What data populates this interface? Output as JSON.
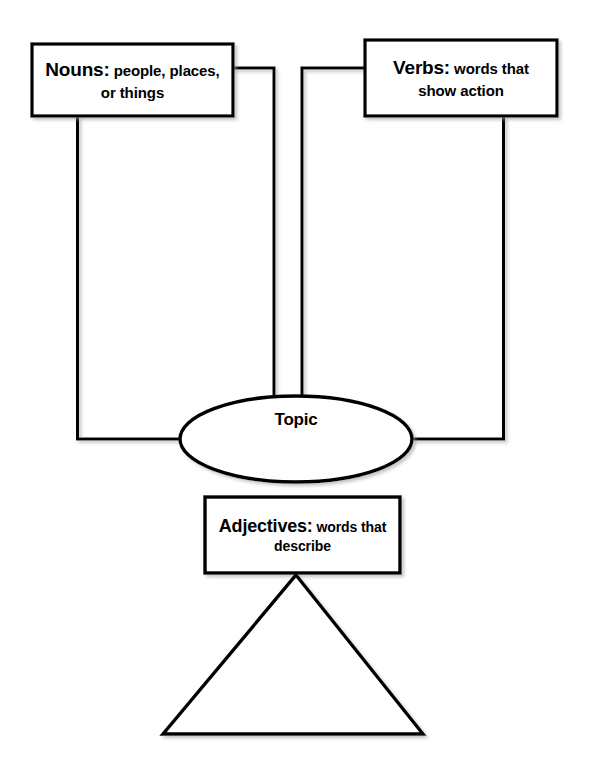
{
  "page": {
    "background_color": "#ffffff",
    "stroke_color": "#000000",
    "fill_color": "#ffffff"
  },
  "nodes": {
    "nouns": {
      "shape": "rectangle",
      "term": "Nouns:",
      "gloss_line1": "people, places,",
      "gloss_line2": "or things"
    },
    "verbs": {
      "shape": "rectangle",
      "term": "Verbs:",
      "gloss_line1": "words that",
      "gloss_line2": "show action"
    },
    "topic": {
      "shape": "ellipse",
      "term": "Topic"
    },
    "adjectives": {
      "shape": "rectangle",
      "term": "Adjectives:",
      "gloss_line1": "words that",
      "gloss_line2": "describe"
    },
    "triangle": {
      "shape": "triangle",
      "term": ""
    }
  },
  "connectors": [
    {
      "name": "nouns-bottom-to-topic-left",
      "from": "nouns",
      "to": "topic",
      "path": "vertical-then-right"
    },
    {
      "name": "nouns-right-to-topic-top",
      "from": "nouns",
      "to": "topic",
      "path": "right-then-vertical"
    },
    {
      "name": "verbs-left-to-topic-top",
      "from": "verbs",
      "to": "topic",
      "path": "left-then-vertical"
    },
    {
      "name": "verbs-bottom-to-topic-right",
      "from": "verbs",
      "to": "topic",
      "path": "vertical-then-left"
    },
    {
      "name": "topic-bottom-to-adjectives",
      "from": "topic",
      "to": "adjectives",
      "path": "direct"
    },
    {
      "name": "adjectives-bottom-to-triangle",
      "from": "adjectives",
      "to": "triangle",
      "path": "direct"
    }
  ]
}
